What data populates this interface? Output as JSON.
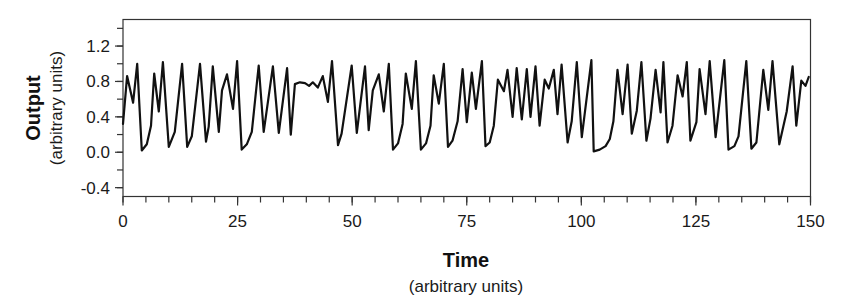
{
  "chart_data": {
    "type": "line",
    "title": "",
    "xlabel": "Time",
    "xlabel_sub": "(arbitrary units)",
    "ylabel": "Output",
    "ylabel_sub": "(arbitrary units)",
    "xlim": [
      0,
      150
    ],
    "ylim": [
      -0.5,
      1.5
    ],
    "x_ticks": [
      0,
      25,
      50,
      75,
      100,
      125,
      150
    ],
    "x_tick_labels": [
      "0",
      "25",
      "50",
      "75",
      "100",
      "125",
      "150"
    ],
    "x_minor_step": 5,
    "y_ticks": [
      -0.4,
      0.0,
      0.4,
      0.8,
      1.2
    ],
    "y_tick_labels": [
      "-0.4",
      "0.0",
      "0.4",
      "0.8",
      "1.2"
    ],
    "y_minor_step": 0.2,
    "grid": false,
    "legend": null,
    "line_color": "#111111",
    "series": [
      {
        "name": "Output",
        "x": [
          0,
          0.9,
          2.2,
          3.1,
          4.1,
          5.2,
          6.1,
          6.8,
          7.8,
          8.7,
          10.0,
          11.3,
          12.9,
          14.0,
          15.0,
          16.8,
          18.1,
          18.7,
          19.6,
          20.9,
          21.6,
          22.7,
          24.0,
          24.9,
          25.9,
          27.0,
          28.1,
          29.6,
          30.7,
          32.7,
          34.0,
          35.8,
          36.6,
          37.5,
          38.6,
          39.7,
          40.6,
          41.4,
          42.5,
          43.6,
          44.7,
          45.6,
          46.9,
          47.7,
          49.9,
          51.0,
          52.8,
          53.6,
          54.5,
          55.8,
          56.9,
          58.0,
          58.9,
          60.0,
          61.0,
          61.7,
          63.0,
          63.9,
          65.0,
          66.1,
          67.1,
          67.8,
          68.9,
          70.0,
          70.9,
          71.9,
          73.0,
          74.1,
          75.0,
          76.1,
          77.0,
          78.3,
          79.1,
          80.0,
          80.9,
          81.8,
          83.1,
          83.9,
          85.0,
          85.9,
          87.0,
          88.1,
          88.9,
          90.0,
          90.9,
          92.0,
          92.9,
          94.0,
          94.8,
          95.7,
          97.0,
          97.9,
          99.0,
          100.1,
          102.2,
          102.7,
          104.0,
          105.3,
          106.2,
          107.0,
          107.9,
          109.0,
          110.1,
          111.0,
          112.1,
          113.1,
          114.2,
          115.1,
          116.2,
          117.3,
          117.9,
          118.8,
          119.9,
          121.0,
          122.1,
          123.0,
          123.8,
          125.1,
          125.8,
          127.1,
          128.0,
          129.3,
          131.2,
          132.1,
          133.4,
          134.3,
          136.0,
          137.1,
          138.2,
          139.7,
          140.8,
          141.7,
          143.2,
          144.8,
          146.1,
          146.9,
          148.0,
          148.9,
          149.6
        ],
        "y": [
          0.32,
          0.86,
          0.56,
          1.0,
          0.02,
          0.09,
          0.3,
          0.89,
          0.46,
          1.02,
          0.06,
          0.23,
          1.0,
          0.06,
          0.18,
          1.0,
          0.12,
          0.29,
          0.97,
          0.23,
          0.7,
          0.88,
          0.49,
          1.03,
          0.03,
          0.09,
          0.23,
          0.98,
          0.23,
          0.97,
          0.22,
          0.95,
          0.2,
          0.77,
          0.79,
          0.78,
          0.75,
          0.79,
          0.73,
          0.86,
          0.57,
          1.03,
          0.08,
          0.21,
          0.98,
          0.22,
          0.97,
          0.25,
          0.7,
          0.88,
          0.46,
          1.0,
          0.03,
          0.1,
          0.32,
          0.89,
          0.49,
          1.03,
          0.03,
          0.1,
          0.3,
          0.87,
          0.55,
          1.0,
          0.06,
          0.13,
          0.35,
          0.94,
          0.34,
          0.9,
          0.49,
          1.03,
          0.07,
          0.11,
          0.3,
          0.82,
          0.69,
          0.93,
          0.4,
          0.95,
          0.37,
          0.94,
          0.4,
          0.97,
          0.3,
          0.82,
          0.72,
          0.93,
          0.43,
          0.99,
          0.11,
          0.35,
          1.02,
          0.17,
          1.04,
          0.01,
          0.03,
          0.07,
          0.15,
          0.35,
          0.93,
          0.43,
          0.99,
          0.21,
          0.47,
          1.02,
          0.13,
          0.38,
          0.93,
          0.45,
          1.02,
          0.11,
          0.3,
          0.87,
          0.63,
          1.02,
          0.13,
          0.34,
          0.94,
          0.43,
          1.03,
          0.17,
          1.04,
          0.03,
          0.07,
          0.18,
          1.03,
          0.04,
          0.11,
          0.93,
          0.48,
          1.03,
          0.09,
          0.46,
          0.97,
          0.3,
          0.81,
          0.75,
          0.85
        ]
      }
    ]
  }
}
